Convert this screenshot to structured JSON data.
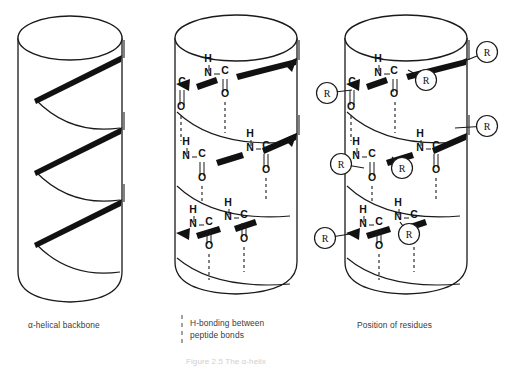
{
  "figure": {
    "stroke_color": "#1a1a1a",
    "ribbon_color": "#111111",
    "caption_color": "#3b3b3b",
    "partial_caption": "Figure 2.5  The α-helix"
  },
  "panels": [
    {
      "id": "alpha-helical-backbone",
      "caption": "α-helical backbone",
      "has_atoms": false,
      "has_residues": false,
      "has_hbond_legend": false
    },
    {
      "id": "h-bonding-between-peptide-bonds",
      "caption": "H-bonding between\npeptide bonds",
      "has_atoms": true,
      "has_residues": false,
      "has_hbond_legend": true
    },
    {
      "id": "position-of-residues",
      "caption": "Position of residues",
      "has_atoms": true,
      "has_residues": true,
      "has_hbond_legend": false
    }
  ],
  "atom_labels": {
    "hydrogen": "H",
    "nitrogen": "N",
    "carbon": "C",
    "oxygen": "O",
    "residue": "R"
  },
  "panel2_atoms": [
    {
      "label": "H",
      "x": 208,
      "y": 62
    },
    {
      "label": "N",
      "x": 208,
      "y": 76
    },
    {
      "label": "C",
      "x": 225,
      "y": 74
    },
    {
      "label": "O",
      "x": 225,
      "y": 97
    },
    {
      "label": "C",
      "x": 182,
      "y": 85
    },
    {
      "label": "O",
      "x": 181,
      "y": 110
    },
    {
      "label": "H",
      "x": 186,
      "y": 145
    },
    {
      "label": "N",
      "x": 186,
      "y": 159
    },
    {
      "label": "C",
      "x": 202,
      "y": 157
    },
    {
      "label": "O",
      "x": 202,
      "y": 181
    },
    {
      "label": "H",
      "x": 250,
      "y": 137
    },
    {
      "label": "N",
      "x": 250,
      "y": 151
    },
    {
      "label": "C",
      "x": 266,
      "y": 149
    },
    {
      "label": "O",
      "x": 266,
      "y": 173
    },
    {
      "label": "H",
      "x": 228,
      "y": 206
    },
    {
      "label": "N",
      "x": 228,
      "y": 220
    },
    {
      "label": "C",
      "x": 244,
      "y": 218
    },
    {
      "label": "O",
      "x": 244,
      "y": 242
    },
    {
      "label": "H",
      "x": 193,
      "y": 213
    },
    {
      "label": "N",
      "x": 193,
      "y": 227
    },
    {
      "label": "C",
      "x": 209,
      "y": 225
    },
    {
      "label": "O",
      "x": 209,
      "y": 249
    }
  ],
  "panel3_atoms": [
    {
      "label": "H",
      "x": 378,
      "y": 62
    },
    {
      "label": "N",
      "x": 378,
      "y": 76
    },
    {
      "label": "C",
      "x": 394,
      "y": 74
    },
    {
      "label": "O",
      "x": 394,
      "y": 97
    },
    {
      "label": "C",
      "x": 352,
      "y": 85
    },
    {
      "label": "O",
      "x": 351,
      "y": 110
    },
    {
      "label": "H",
      "x": 356,
      "y": 145
    },
    {
      "label": "N",
      "x": 356,
      "y": 159
    },
    {
      "label": "C",
      "x": 372,
      "y": 157
    },
    {
      "label": "O",
      "x": 372,
      "y": 181
    },
    {
      "label": "H",
      "x": 420,
      "y": 137
    },
    {
      "label": "N",
      "x": 420,
      "y": 151
    },
    {
      "label": "C",
      "x": 436,
      "y": 149
    },
    {
      "label": "O",
      "x": 436,
      "y": 173
    },
    {
      "label": "H",
      "x": 398,
      "y": 206
    },
    {
      "label": "N",
      "x": 398,
      "y": 220
    },
    {
      "label": "C",
      "x": 414,
      "y": 218
    },
    {
      "label": "O",
      "x": 414,
      "y": 242
    },
    {
      "label": "H",
      "x": 363,
      "y": 213
    },
    {
      "label": "N",
      "x": 363,
      "y": 227
    },
    {
      "label": "C",
      "x": 379,
      "y": 225
    },
    {
      "label": "O",
      "x": 379,
      "y": 249
    }
  ],
  "residues": [
    {
      "label": "R",
      "cx": 487,
      "cy": 52,
      "tx": 462,
      "ty": 62
    },
    {
      "label": "R",
      "cx": 426,
      "cy": 80,
      "tx": 408,
      "ty": 70
    },
    {
      "label": "R",
      "cx": 327,
      "cy": 93,
      "tx": 352,
      "ty": 90
    },
    {
      "label": "R",
      "cx": 487,
      "cy": 126,
      "tx": 455,
      "ty": 128
    },
    {
      "label": "R",
      "cx": 341,
      "cy": 164,
      "tx": 364,
      "ty": 168
    },
    {
      "label": "R",
      "cx": 402,
      "cy": 168,
      "tx": 392,
      "ty": 157
    },
    {
      "label": "R",
      "cx": 409,
      "cy": 234,
      "tx": 400,
      "ty": 222
    },
    {
      "label": "R",
      "cx": 325,
      "cy": 238,
      "tx": 350,
      "ty": 234
    }
  ]
}
